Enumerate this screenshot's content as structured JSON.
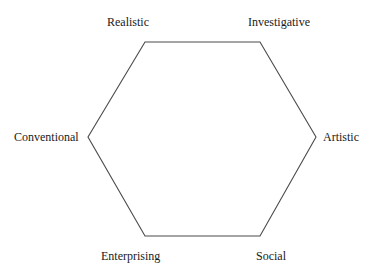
{
  "diagram": {
    "type": "hexagon",
    "title": "",
    "stroke_color": "#4a4a4a",
    "vertices": [
      {
        "name": "Realistic",
        "x": 145,
        "y": 42
      },
      {
        "name": "Investigative",
        "x": 260,
        "y": 42
      },
      {
        "name": "Artistic",
        "x": 316,
        "y": 137
      },
      {
        "name": "Social",
        "x": 260,
        "y": 236
      },
      {
        "name": "Enterprising",
        "x": 145,
        "y": 236
      },
      {
        "name": "Conventional",
        "x": 88,
        "y": 137
      }
    ],
    "labels": {
      "realistic": "Realistic",
      "investigative": "Investigative",
      "artistic": "Artistic",
      "social": "Social",
      "enterprising": "Enterprising",
      "conventional": "Conventional"
    }
  }
}
